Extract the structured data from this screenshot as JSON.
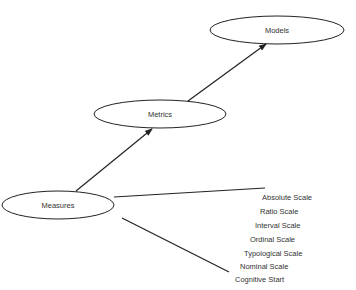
{
  "diagram": {
    "nodes": [
      {
        "id": "models",
        "label": "Models",
        "cx": 277,
        "cy": 30,
        "rx": 67,
        "ry": 14
      },
      {
        "id": "metrics",
        "label": "Metrics",
        "cx": 160,
        "cy": 114,
        "rx": 66,
        "ry": 14
      },
      {
        "id": "measures",
        "label": "Measures",
        "cx": 58,
        "cy": 205,
        "rx": 56,
        "ry": 14
      }
    ],
    "edges": [
      {
        "from": "measures",
        "to": "metrics",
        "type": "arrow"
      },
      {
        "from": "metrics",
        "to": "models",
        "type": "arrow"
      }
    ],
    "scale_range": {
      "upper_line_end": "Absolute Scale",
      "lower_line_end": "Cognitive Start",
      "labels": [
        {
          "text": "Absolute Scale",
          "x": 262,
          "y": 193
        },
        {
          "text": "Ratio Scale",
          "x": 260,
          "y": 207
        },
        {
          "text": "Interval Scale",
          "x": 255,
          "y": 221
        },
        {
          "text": "Ordinal Scale",
          "x": 250,
          "y": 235
        },
        {
          "text": "Typological Scale",
          "x": 244,
          "y": 249
        },
        {
          "text": "Nominal Scale",
          "x": 240,
          "y": 262
        },
        {
          "text": "Cognitive Start",
          "x": 235,
          "y": 275
        }
      ]
    },
    "stroke_color": "#222222",
    "text_color": "#333333"
  }
}
